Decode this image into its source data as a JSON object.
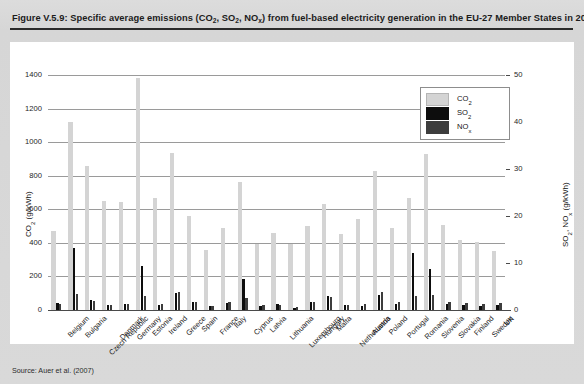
{
  "figure": {
    "title_prefix": "Figure V.5.9: Specific average emissions (CO",
    "title_full": "Figure V.5.9: Specific average emissions (CO2, SO2, NOx) from fuel-based electricity generation in the EU-27 Member States in 2020",
    "source": "Source: Auer et al. (2007)"
  },
  "legend": {
    "position": "top-right-inside",
    "items": [
      {
        "name": "CO2",
        "label_main": "CO",
        "label_sub": "2",
        "color": "#d4d4d4"
      },
      {
        "name": "SO2",
        "label_main": "SO",
        "label_sub": "2",
        "color": "#0d0d0d"
      },
      {
        "name": "NOx",
        "label_main": "NO",
        "label_sub": "x",
        "color": "#3d3d3d"
      }
    ]
  },
  "axes": {
    "left": {
      "title_main": "CO",
      "title_sub": "2",
      "title_unit": " (g/kWh)",
      "ticks": [
        0,
        200,
        400,
        600,
        800,
        1000,
        1200,
        1400
      ],
      "min": 0,
      "max": 1400
    },
    "right": {
      "title_main": "SO",
      "title_sub": "2",
      "title_main2": ", NO",
      "title_sub2": "x",
      "title_unit": " (g/kWh)",
      "ticks": [
        0,
        10,
        20,
        30,
        40,
        50
      ],
      "min": 0,
      "max": 50
    }
  },
  "chart_data": {
    "type": "bar",
    "title": "Figure V.5.9: Specific average emissions (CO2, SO2, NOx) from fuel-based electricity generation in the EU-27 Member States in 2020",
    "xlabel": "",
    "ylabel": "CO2 (g/kWh)",
    "ylabel_secondary": "SO2, NOx (g/kWh)",
    "ylim": [
      0,
      1400
    ],
    "ylim_secondary": [
      0,
      50
    ],
    "grid": true,
    "legend_position": "upper right",
    "categories": [
      "Belgium",
      "Bulgaria",
      "Czech Republic",
      "Denmark",
      "Germany",
      "Estonia",
      "Ireland",
      "Greece",
      "Spain",
      "France",
      "Italy",
      "Cyprus",
      "Latvia",
      "Lithuania",
      "Luxembourg",
      "Hungary",
      "Malta",
      "Netherlands",
      "Austria",
      "Poland",
      "Portugal",
      "Romania",
      "Slovenia",
      "Slovakia",
      "Finland",
      "Sweden",
      "UK"
    ],
    "series": [
      {
        "name": "CO2",
        "axis": "left",
        "unit": "g/kWh",
        "color": "#d4d4d4",
        "values": [
          470,
          1120,
          855,
          650,
          645,
          1385,
          665,
          935,
          560,
          355,
          490,
          765,
          395,
          460,
          395,
          500,
          630,
          450,
          540,
          830,
          490,
          670,
          930,
          505,
          415,
          405,
          350
        ]
      },
      {
        "name": "SO2",
        "axis": "right",
        "unit": "g/kWh",
        "color": "#0d0d0d",
        "values": [
          1.5,
          13.2,
          2.1,
          1.0,
          1.2,
          9.4,
          1.1,
          3.6,
          1.8,
          0.9,
          1.5,
          6.5,
          0.9,
          1.2,
          0.5,
          1.6,
          3.0,
          1.0,
          0.8,
          3.1,
          1.3,
          12.1,
          8.8,
          1.2,
          1.1,
          0.9,
          1.0
        ]
      },
      {
        "name": "NOx",
        "axis": "right",
        "unit": "g/kWh",
        "color": "#3d3d3d",
        "values": [
          1.3,
          3.4,
          1.9,
          1.1,
          1.2,
          3.0,
          1.2,
          3.9,
          1.7,
          0.8,
          1.6,
          2.5,
          1.0,
          1.1,
          0.7,
          1.7,
          2.7,
          1.1,
          1.2,
          3.9,
          1.6,
          2.9,
          3.3,
          1.6,
          1.4,
          1.3,
          1.4
        ]
      }
    ]
  }
}
